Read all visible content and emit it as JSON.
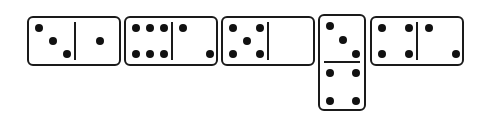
{
  "dominoes": [
    {
      "id": 1,
      "orientation": "horizontal",
      "left_pips": 3,
      "right_pips": 1,
      "label": "3-1"
    },
    {
      "id": 2,
      "orientation": "horizontal",
      "left_pips": 6,
      "right_pips": 2,
      "label": "6-2"
    },
    {
      "id": 3,
      "orientation": "horizontal",
      "left_pips": 5,
      "right_pips": 0,
      "label": "5-0"
    },
    {
      "id": 4,
      "orientation": "vertical",
      "top_pips": 3,
      "bottom_pips": 4,
      "label": "3-4"
    },
    {
      "id": 5,
      "orientation": "horizontal",
      "left_pips": 4,
      "right_pips": 2,
      "label": "4-2"
    }
  ],
  "colors": {
    "ink": "#1a1a1a",
    "background": "#ffffff"
  }
}
